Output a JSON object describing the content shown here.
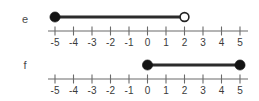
{
  "figure": {
    "background_color": "#ffffff",
    "axis_color": "#6b6b6b",
    "segment_color": "#2b2b2b",
    "dot_fill_color": "#141414",
    "dot_open_fill_color": "#ffffff",
    "label_color": "#3a3a3a"
  },
  "chart_data": {
    "type": "line",
    "title": "",
    "xlabel": "",
    "ylabel": "",
    "xlim": [
      -5,
      5
    ],
    "grid": false,
    "legend": "none",
    "tick_labels": [
      "-5",
      "-4",
      "-3",
      "-2",
      "-1",
      "0",
      "1",
      "2",
      "3",
      "4",
      "5"
    ],
    "tick_values": [
      -5,
      -4,
      -3,
      -2,
      -1,
      0,
      1,
      2,
      3,
      4,
      5
    ],
    "series": [
      {
        "name": "e",
        "label": "e",
        "start": -5,
        "end": 2,
        "start_endpoint": "closed",
        "end_endpoint": "open",
        "interval_notation": "[-5, 2)"
      },
      {
        "name": "f",
        "label": "f",
        "start": 0,
        "end": 5,
        "start_endpoint": "closed",
        "end_endpoint": "closed",
        "interval_notation": "[0, 5]"
      }
    ]
  },
  "lines": {
    "e": {
      "label": "e",
      "ticks": [
        "-5",
        "-4",
        "-3",
        "-2",
        "-1",
        "0",
        "1",
        "2",
        "3",
        "4",
        "5"
      ]
    },
    "f": {
      "label": "f",
      "ticks": [
        "-5",
        "-4",
        "-3",
        "-2",
        "-1",
        "0",
        "1",
        "2",
        "3",
        "4",
        "5"
      ]
    }
  }
}
